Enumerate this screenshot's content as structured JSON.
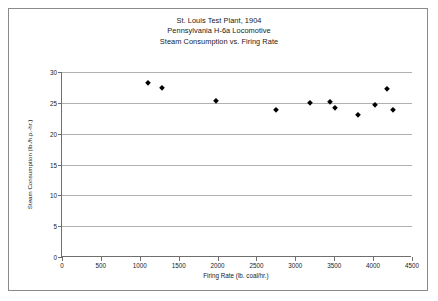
{
  "chart_data": {
    "type": "scatter",
    "title": "St. Louis Test Plant, 1904",
    "subtitle": "Pennsylvania H-6a Locomotive",
    "subtitle2": "Steam Consumption vs. Firing Rate",
    "title_lines": [
      "St. Louis Test Plant, 1904",
      "Pennsylvania H-6a Locomotive",
      "Steam Consumption vs. Firing Rate"
    ],
    "xlabel": "Firing Rate (lb. coal/hr.)",
    "ylabel": "Steam Consumption (lb./h.p.-hr.)",
    "xlim": [
      0,
      4500
    ],
    "ylim": [
      0,
      30
    ],
    "xticks": [
      0,
      500,
      1000,
      1500,
      2000,
      2500,
      3000,
      3500,
      4000,
      4500
    ],
    "xtick_labels": [
      "0",
      "500",
      "1000",
      "1500",
      "2000",
      "2500",
      "3000",
      "3500",
      "4000",
      "4500"
    ],
    "yticks": [
      0,
      5,
      10,
      15,
      20,
      25,
      30
    ],
    "ytick_labels": [
      "0",
      "5",
      "10",
      "15",
      "20",
      "25",
      "30"
    ],
    "grid": "horizontal",
    "legend": "none",
    "marker": "diamond",
    "marker_color": "#000000",
    "gridline_color": "#b0b0b0",
    "axis_color": "#6f6f6f",
    "frame_color": "#8a8a8a",
    "points": [
      {
        "x": 1100,
        "y": 28.2
      },
      {
        "x": 1285,
        "y": 27.4
      },
      {
        "x": 1980,
        "y": 25.3
      },
      {
        "x": 2750,
        "y": 23.9
      },
      {
        "x": 3190,
        "y": 24.9
      },
      {
        "x": 3450,
        "y": 25.1
      },
      {
        "x": 3510,
        "y": 24.1
      },
      {
        "x": 3800,
        "y": 23.1
      },
      {
        "x": 4020,
        "y": 24.6
      },
      {
        "x": 4180,
        "y": 27.3
      },
      {
        "x": 4250,
        "y": 23.8
      }
    ]
  }
}
